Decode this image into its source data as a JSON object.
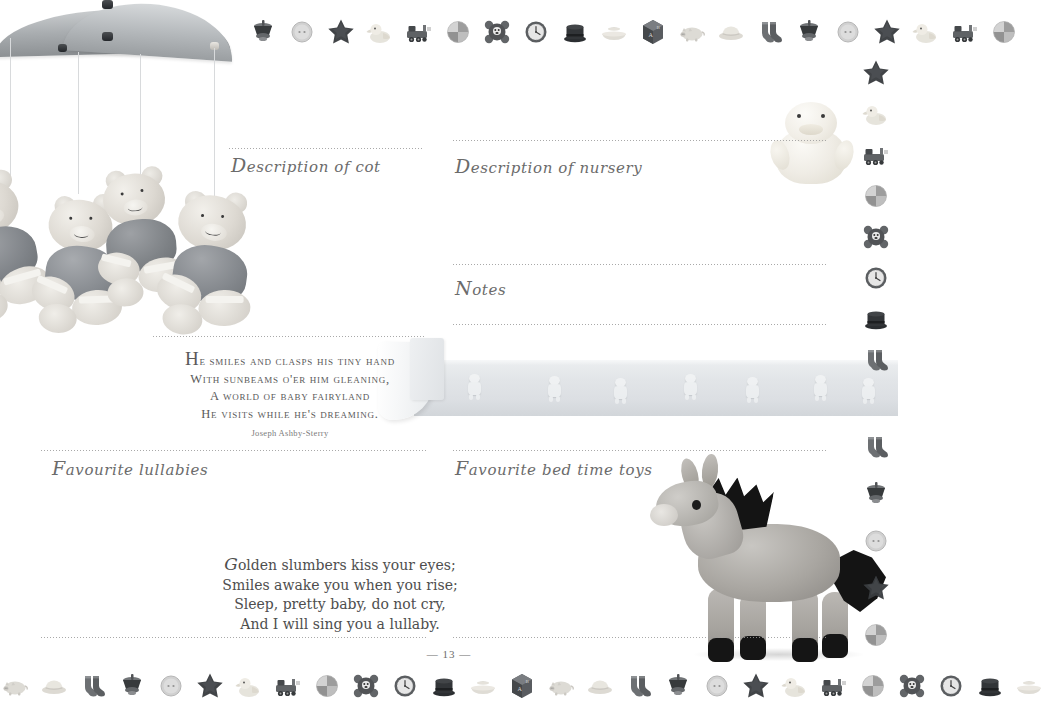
{
  "page": {
    "number": "13",
    "number_display": "— 13 —",
    "background_color": "#ffffff",
    "text_color": "#4a4a4a",
    "rule_color": "#9a9a9a"
  },
  "fields": [
    {
      "id": "description-of-cot",
      "label": "Description of cot",
      "initial": "D",
      "rest": "escription of cot"
    },
    {
      "id": "description-of-nursery",
      "label": "Description of nursery",
      "initial": "D",
      "rest": "escription of nursery"
    },
    {
      "id": "notes",
      "label": "Notes",
      "initial": "N",
      "rest": "otes"
    },
    {
      "id": "favourite-lullabies",
      "label": "Favourite lullabies",
      "initial": "F",
      "rest": "avourite lullabies"
    },
    {
      "id": "favourite-bed-time-toys",
      "label": "Favourite bed time toys",
      "initial": "F",
      "rest": "avourite bed time toys"
    }
  ],
  "poems": [
    {
      "id": "baby-fairyland",
      "dropcap": "H",
      "lines": [
        "e smiles and clasps his tiny hand",
        "With sunbeams o'er him gleaning,",
        "A world of baby fairyland",
        "He visits while he's dreaming."
      ],
      "attribution": "Joseph Ashby-Sterry"
    },
    {
      "id": "golden-slumbers",
      "dropcap": "G",
      "lines": [
        "olden slumbers kiss your eyes;",
        "Smiles awake you when you rise;",
        "Sleep, pretty baby, do not cry,",
        "And I will sing you a lullaby."
      ],
      "attribution": ""
    }
  ],
  "photos": [
    {
      "id": "baby-mobile-with-teddy-bears",
      "caption": "Baby mobile with four hanging teddy bears"
    },
    {
      "id": "plush-duck",
      "caption": "Soft plush duckling toy"
    },
    {
      "id": "wallpaper-border-roll",
      "caption": "Teddy bear nursery wallpaper border roll"
    },
    {
      "id": "plush-donkey",
      "caption": "Grey plush donkey soft toy"
    }
  ],
  "borders": {
    "top_icons": [
      "spinning-top",
      "button",
      "star",
      "duck",
      "train",
      "ball",
      "bear",
      "clock",
      "top-hat",
      "boat",
      "block",
      "pig",
      "hat",
      "socks",
      "spinning-top",
      "button",
      "star",
      "duck",
      "train",
      "ball"
    ],
    "bottom_icons": [
      "pig",
      "hat",
      "socks",
      "spinning-top",
      "button",
      "star",
      "duck",
      "train",
      "ball",
      "bear",
      "clock",
      "top-hat",
      "boat",
      "block",
      "pig",
      "hat",
      "socks",
      "spinning-top",
      "button",
      "star",
      "duck",
      "train",
      "ball",
      "bear",
      "clock",
      "top-hat",
      "boat"
    ],
    "right_upper_icons": [
      "star",
      "duck",
      "train",
      "ball",
      "bear",
      "clock",
      "top-hat",
      "socks"
    ],
    "right_lower_icons": [
      "socks",
      "spinning-top",
      "button",
      "star",
      "ball"
    ]
  }
}
